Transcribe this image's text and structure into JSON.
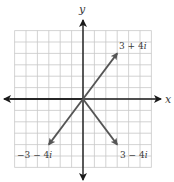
{
  "diagram": {
    "axes": {
      "x_label": "x",
      "y_label": "y"
    },
    "grid": {
      "cells": 12,
      "range": [
        -6,
        6
      ],
      "color": "#c8c8c8"
    },
    "colors": {
      "axis": "#1a1a1a",
      "vector": "#555555",
      "label": "#3a3a3a"
    },
    "vectors": [
      {
        "id": "v1",
        "re": 3,
        "im": 4,
        "label_re": "3 + 4",
        "label_i": "i"
      },
      {
        "id": "v2",
        "re": -3,
        "im": -4,
        "label_re": "−3 − 4",
        "label_i": "i"
      },
      {
        "id": "v3",
        "re": 3,
        "im": -4,
        "label_re": "3 − 4",
        "label_i": "i"
      }
    ]
  }
}
